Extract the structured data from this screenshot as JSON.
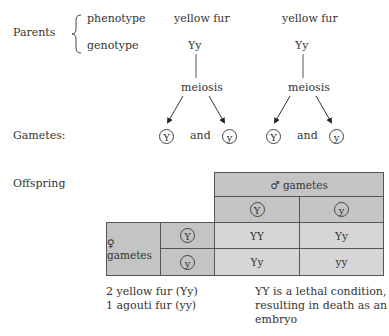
{
  "parents": {
    "label": "Parents",
    "phenotype_label": "phenotype",
    "genotype_label": "genotype",
    "parent1": {
      "phenotype": "yellow fur",
      "genotype": "Yy"
    },
    "parent2": {
      "phenotype": "yellow fur",
      "genotype": "Yy"
    }
  },
  "meiosis": {
    "label1": "meiosis",
    "label2": "meiosis"
  },
  "gametes": {
    "label": "Gametes:",
    "parent1": {
      "g1": "Y",
      "and": "and",
      "g2": "y"
    },
    "parent2": {
      "g1": "Y",
      "and": "and",
      "g2": "y"
    }
  },
  "offspring": {
    "label": "Offspring",
    "male_header": "♂ gametes",
    "female_header": "♀ gametes",
    "male_alleles": [
      "Y",
      "y"
    ],
    "female_alleles": [
      "Y",
      "y"
    ],
    "cells": [
      [
        "YY",
        "Yy"
      ],
      [
        "Yy",
        "yy"
      ]
    ]
  },
  "notes": {
    "ratio_line1": "2 yellow fur (Yy)",
    "ratio_line2": "1 agouti fur (yy)",
    "lethal_line1": "YY is a lethal condition,",
    "lethal_line2": "resulting in death as an",
    "lethal_line3": "embryo"
  },
  "colors": {
    "table_dark": "#c4c4c4",
    "table_light": "#d6d6d6",
    "lines": "#555555"
  }
}
